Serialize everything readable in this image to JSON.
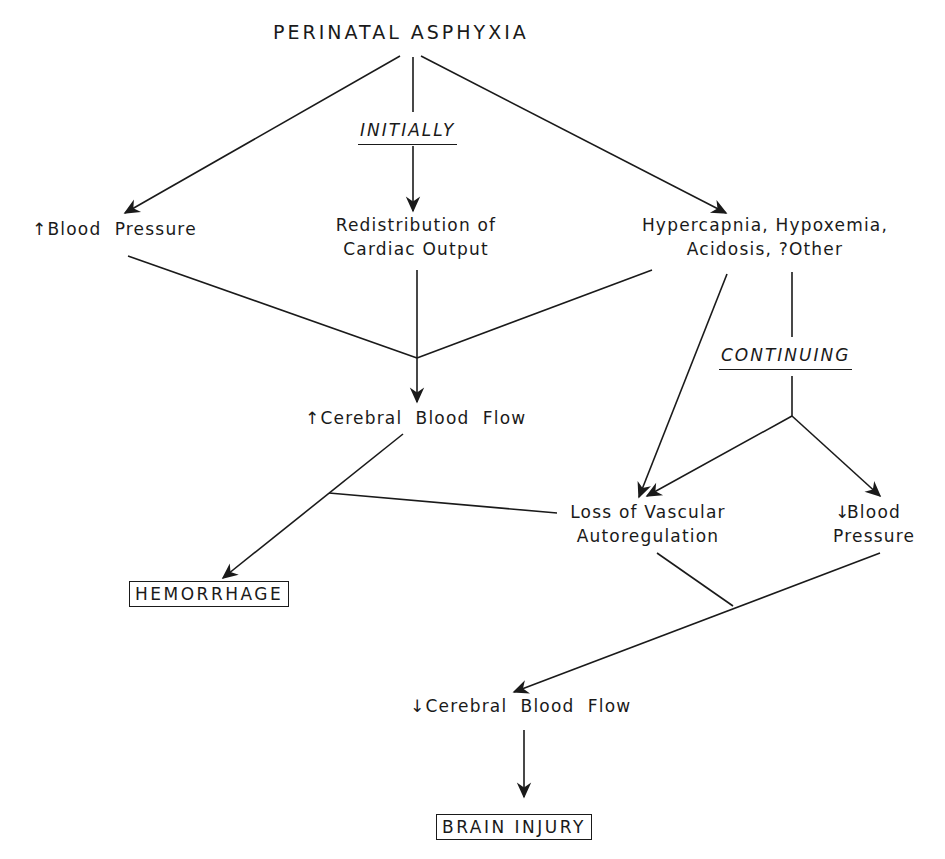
{
  "diagram": {
    "title": "PERINATAL ASPHYXIA",
    "phases": {
      "initially": "INITIALLY",
      "continuing": "CONTINUING"
    },
    "nodes": {
      "blood_pressure_up": {
        "arrow": "↑",
        "label": "Blood  Pressure"
      },
      "redistribution": {
        "line1": "Redistribution of",
        "line2": "Cardiac Output"
      },
      "blood_gases": {
        "line1": "Hypercapnia, Hypoxemia,",
        "line2": "Acidosis, ?Other"
      },
      "cerebral_flow_up": {
        "arrow": "↑",
        "label": "Cerebral  Blood  Flow"
      },
      "loss_autoregulation": {
        "line1": "Loss of Vascular",
        "line2": "Autoregulation"
      },
      "blood_pressure_down": {
        "arrow": "↓",
        "line1": "Blood",
        "line2": "Pressure"
      },
      "hemorrhage": "HEMORRHAGE",
      "cerebral_flow_down": {
        "arrow": "↓",
        "label": "Cerebral  Blood  Flow"
      },
      "brain_injury": "BRAIN INJURY"
    },
    "edges": [
      {
        "from": "PERINATAL ASPHYXIA",
        "to": "↑Blood Pressure"
      },
      {
        "from": "PERINATAL ASPHYXIA",
        "to": "Redistribution of Cardiac Output",
        "via": "INITIALLY"
      },
      {
        "from": "PERINATAL ASPHYXIA",
        "to": "Hypercapnia, Hypoxemia, Acidosis, ?Other"
      },
      {
        "from": [
          "↑Blood Pressure",
          "Redistribution of Cardiac Output",
          "Hypercapnia, Hypoxemia, Acidosis, ?Other"
        ],
        "to": "↑Cerebral Blood Flow"
      },
      {
        "from": "Hypercapnia, Hypoxemia, Acidosis, ?Other",
        "to": "Loss of Vascular Autoregulation"
      },
      {
        "from": "Hypercapnia, Hypoxemia, Acidosis, ?Other",
        "to": [
          "Loss of Vascular Autoregulation",
          "↓Blood Pressure"
        ],
        "via": "CONTINUING"
      },
      {
        "from": [
          "↑Cerebral Blood Flow",
          "Loss of Vascular Autoregulation"
        ],
        "to": "HEMORRHAGE"
      },
      {
        "from": [
          "Loss of Vascular Autoregulation",
          "↓Blood Pressure"
        ],
        "to": "↓Cerebral Blood Flow"
      },
      {
        "from": "↓Cerebral Blood Flow",
        "to": "BRAIN INJURY"
      }
    ],
    "colors": {
      "ink": "#1a1a1a",
      "background": "#ffffff"
    }
  }
}
